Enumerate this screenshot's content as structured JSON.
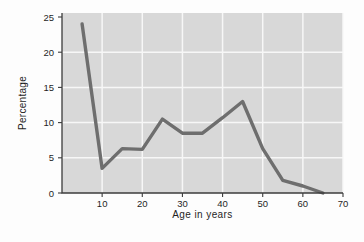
{
  "figure": {
    "background": "#fdfdfd",
    "plot_background": "#d8d8d8",
    "grid_color": "#f7f7f7",
    "axis_color": "#3c3c3c",
    "line_color": "#6e6e6e",
    "text_color": "#1f1f1f"
  },
  "chart_data": {
    "type": "line",
    "title": "",
    "xlabel": "Age in years",
    "ylabel": "Percentage",
    "x": [
      5,
      10,
      15,
      20,
      25,
      30,
      35,
      40,
      45,
      50,
      55,
      60,
      65
    ],
    "y": [
      24,
      3.5,
      6.3,
      6.2,
      10.5,
      8.5,
      8.5,
      10.7,
      13,
      6.3,
      1.8,
      1.0,
      0
    ],
    "xlim": [
      0,
      70
    ],
    "ylim": [
      0,
      25
    ],
    "x_ticks": [
      10,
      20,
      30,
      40,
      50,
      60,
      70
    ],
    "y_ticks": [
      0,
      5,
      10,
      15,
      20,
      25
    ],
    "grid": "on",
    "legend": "none"
  }
}
